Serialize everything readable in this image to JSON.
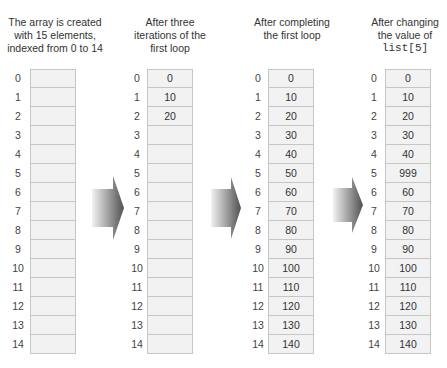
{
  "columns": [
    {
      "caption_lines": [
        "The array is created",
        "with 15 elements,",
        "indexed from 0 to 14"
      ],
      "caption_code": "",
      "indices": [
        "0",
        "1",
        "2",
        "3",
        "4",
        "5",
        "6",
        "7",
        "8",
        "9",
        "10",
        "11",
        "12",
        "13",
        "14"
      ],
      "values": [
        "",
        "",
        "",
        "",
        "",
        "",
        "",
        "",
        "",
        "",
        "",
        "",
        "",
        "",
        ""
      ]
    },
    {
      "caption_lines": [
        "After three",
        "iterations of the",
        "first loop"
      ],
      "caption_code": "",
      "indices": [
        "0",
        "1",
        "2",
        "3",
        "4",
        "5",
        "6",
        "7",
        "8",
        "9",
        "10",
        "11",
        "12",
        "13",
        "14"
      ],
      "values": [
        "0",
        "10",
        "20",
        "",
        "",
        "",
        "",
        "",
        "",
        "",
        "",
        "",
        "",
        "",
        ""
      ]
    },
    {
      "caption_lines": [
        "After completing",
        "the first loop"
      ],
      "caption_code": "",
      "indices": [
        "0",
        "1",
        "2",
        "3",
        "4",
        "5",
        "6",
        "7",
        "8",
        "9",
        "10",
        "11",
        "12",
        "13",
        "14"
      ],
      "values": [
        "0",
        "10",
        "20",
        "30",
        "40",
        "50",
        "60",
        "70",
        "80",
        "90",
        "100",
        "110",
        "120",
        "130",
        "140"
      ]
    },
    {
      "caption_lines": [
        "After changing",
        "the value of"
      ],
      "caption_code": "list[5]",
      "indices": [
        "0",
        "1",
        "2",
        "3",
        "4",
        "5",
        "6",
        "7",
        "8",
        "9",
        "10",
        "11",
        "12",
        "13",
        "14"
      ],
      "values": [
        "0",
        "10",
        "20",
        "30",
        "40",
        "999",
        "60",
        "70",
        "80",
        "90",
        "100",
        "110",
        "120",
        "130",
        "140"
      ]
    }
  ],
  "arrows": [
    {
      "icon": "right-arrow-icon"
    },
    {
      "icon": "right-arrow-icon"
    },
    {
      "icon": "right-arrow-icon"
    }
  ],
  "colors": {
    "cell_fill": "#f2f2f2",
    "cell_border": "#c6c6c6",
    "arrow_light": "#f0f0f0",
    "arrow_dark": "#555555"
  }
}
